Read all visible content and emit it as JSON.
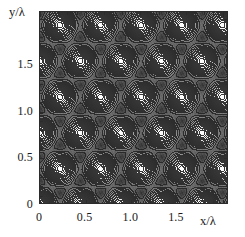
{
  "figure": {
    "kind": "contour-plot",
    "background_color": "#ffffff",
    "frame_color": "#2b2b2b"
  },
  "axes": {
    "x": {
      "title": "x/λ",
      "tick_labels": [
        "0",
        "0.5",
        "1.0",
        "1.5"
      ],
      "tick_values": [
        0,
        0.5,
        1.0,
        1.5
      ],
      "range": [
        0,
        2.07
      ],
      "minor_ticks": true
    },
    "y": {
      "title": "y/λ",
      "tick_labels": [
        "0",
        "0.5",
        "1.0",
        "1.5"
      ],
      "tick_values": [
        0,
        0.5,
        1.0,
        1.5
      ],
      "range": [
        0,
        2.07
      ],
      "minor_ticks": true
    }
  },
  "chart_data": {
    "type": "heatmap",
    "subtype": "filled-contour",
    "title": "",
    "xlabel": "x/λ",
    "ylabel": "y/λ",
    "xlim": [
      0,
      2.07
    ],
    "ylim": [
      0,
      2.07
    ],
    "xticks": [
      0,
      0.5,
      1.0,
      1.5
    ],
    "yticks": [
      0,
      0.5,
      1.0,
      1.5
    ],
    "grid": false,
    "legend": "none",
    "colormap": "grayscale",
    "colormap_low": "#3a3a3a",
    "colormap_high": "#ffffff",
    "n_contour_levels": 14,
    "contour_line_color": "#2f2f2f",
    "lattice": {
      "type": "triangular",
      "period_x": 0.6667,
      "period_y": 0.5774,
      "maxima_positions": [
        [
          0.0,
          0.0
        ],
        [
          0.667,
          0.0
        ],
        [
          1.333,
          0.0
        ],
        [
          2.0,
          0.0
        ],
        [
          0.333,
          0.577
        ],
        [
          1.0,
          0.577
        ],
        [
          1.667,
          0.577
        ],
        [
          0.0,
          1.155
        ],
        [
          0.667,
          1.155
        ],
        [
          1.333,
          1.155
        ],
        [
          2.0,
          1.155
        ],
        [
          0.333,
          1.732
        ],
        [
          1.0,
          1.732
        ],
        [
          1.667,
          1.732
        ]
      ],
      "minima_positions": [
        [
          0.0,
          0.385
        ],
        [
          0.667,
          0.385
        ],
        [
          1.333,
          0.385
        ],
        [
          2.0,
          0.385
        ],
        [
          0.333,
          0.962
        ],
        [
          1.0,
          0.962
        ],
        [
          1.667,
          0.962
        ],
        [
          0.0,
          1.54
        ],
        [
          0.667,
          1.54
        ],
        [
          1.333,
          1.54
        ],
        [
          2.0,
          1.54
        ],
        [
          0.333,
          0.192
        ],
        [
          1.0,
          0.192
        ],
        [
          1.667,
          0.192
        ]
      ]
    },
    "value_range": [
      0.0,
      1.0
    ],
    "contour_levels": [
      0.06,
      0.13,
      0.2,
      0.27,
      0.34,
      0.41,
      0.48,
      0.55,
      0.62,
      0.69,
      0.76,
      0.83,
      0.9,
      0.96
    ]
  }
}
